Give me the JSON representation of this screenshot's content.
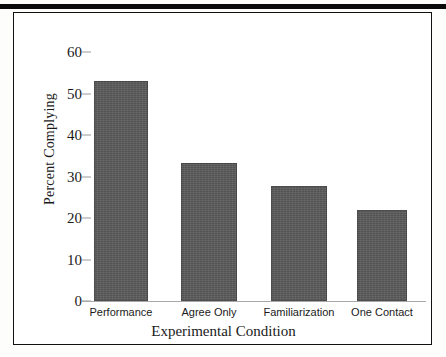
{
  "figure": {
    "has_top_rule": true,
    "has_border_box": true,
    "bar_color": "#5b5b5b",
    "axis_color": "#a8a8a8",
    "text_color": "#1a1a1a"
  },
  "chart_data": {
    "type": "bar",
    "title": "",
    "xlabel": "Experimental Condition",
    "ylabel": "Percent Complying",
    "categories": [
      "Performance",
      "Agree Only",
      "Familiarization",
      "One Contact"
    ],
    "values": [
      53.0,
      33.3,
      27.7,
      22.0
    ],
    "ylim": [
      0,
      60
    ],
    "yticks": [
      0,
      10,
      20,
      30,
      40,
      50,
      60
    ],
    "ytick_labels": [
      "0",
      "10",
      "20",
      "30",
      "40",
      "50",
      "60"
    ],
    "grid": false,
    "legend": null,
    "series": [
      {
        "name": "Percent Complying",
        "values": [
          53.0,
          33.3,
          27.7,
          22.0
        ]
      }
    ]
  }
}
